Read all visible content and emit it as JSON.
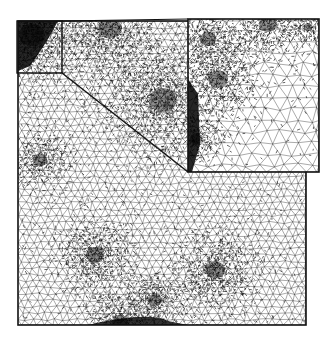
{
  "figure": {
    "colors": {
      "background": "#ffffff",
      "mesh_line": "#000000",
      "frame": "#111111"
    },
    "main_domain": {
      "x": 18,
      "y": 21,
      "width": 288,
      "height": 304
    },
    "zoom_region": {
      "x": 17,
      "y": 21,
      "width": 45,
      "height": 52
    },
    "inset": {
      "x": 188,
      "y": 19,
      "width": 131,
      "height": 153
    },
    "dense_regions": [
      {
        "name": "top-left-corner",
        "cx": 32,
        "cy": 35,
        "r": 28
      },
      {
        "name": "center-vortex",
        "cx": 163,
        "cy": 100,
        "r": 30
      },
      {
        "name": "top-band",
        "cx": 110,
        "cy": 28,
        "r": 26
      },
      {
        "name": "bottom-center",
        "cx": 155,
        "cy": 300,
        "r": 16
      },
      {
        "name": "bottom-edge",
        "cx": 120,
        "cy": 322,
        "r": 18
      },
      {
        "name": "left-middle",
        "cx": 40,
        "cy": 160,
        "r": 16
      },
      {
        "name": "lower-left-vortex",
        "cx": 95,
        "cy": 255,
        "r": 20
      },
      {
        "name": "lower-right-vortex",
        "cx": 215,
        "cy": 270,
        "r": 22
      }
    ]
  }
}
